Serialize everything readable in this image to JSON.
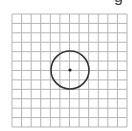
{
  "figure": {
    "partial_label": "g",
    "grid": {
      "x0": 12,
      "y0": 14,
      "x1": 127,
      "y1": 127,
      "columns": 12,
      "rows": 12,
      "line_color": "#b5b5b5"
    },
    "circle": {
      "cx": 70,
      "cy": 70,
      "r": 19,
      "stroke_color": "#333333",
      "stroke_width": 1.6
    },
    "center_point": {
      "cx": 70,
      "cy": 70,
      "r": 1.6,
      "fill_color": "#222222"
    }
  }
}
